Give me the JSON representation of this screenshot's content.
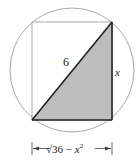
{
  "diagram": {
    "type": "geometry",
    "labels": {
      "hypotenuse": "6",
      "vertical_side": "x",
      "horizontal_dimension_prefix": "√36 − ",
      "horizontal_dimension_var": "x",
      "horizontal_dimension_exp": "2"
    },
    "colors": {
      "circle": "#aaaaaa",
      "rectangle": "#aaaaaa",
      "shading": "#bdbdbd",
      "edges": "#222222"
    }
  }
}
